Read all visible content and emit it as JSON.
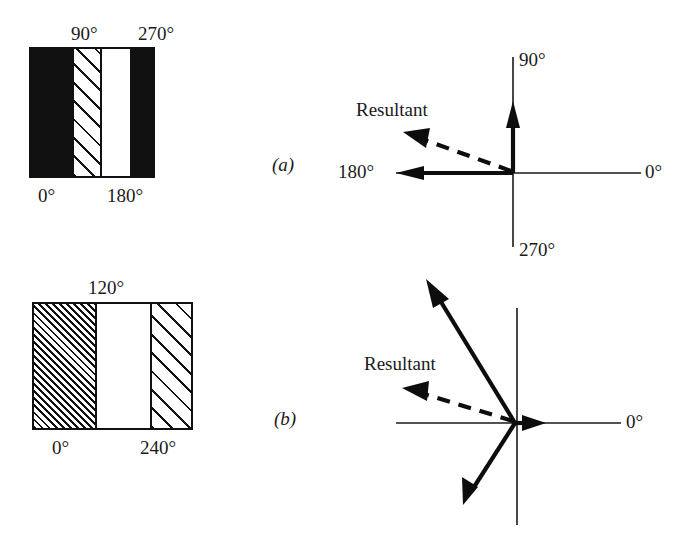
{
  "figure": {
    "panels": [
      {
        "mark": "(a)",
        "bar": {
          "labels_top": [
            "90°",
            "270°"
          ],
          "labels_bottom": [
            "0°",
            "180°"
          ],
          "bands": [
            {
              "fill": "black",
              "start_deg": 0
            },
            {
              "fill": "hatched",
              "start_deg": 90
            },
            {
              "fill": "white",
              "start_deg": 180
            },
            {
              "fill": "black",
              "start_deg": 270
            }
          ]
        },
        "vector_plot": {
          "axis_labels": {
            "right": "0°",
            "up": "90°",
            "left": "180°",
            "down": "270°"
          },
          "vectors": [
            {
              "label": "90°",
              "angle_deg": 90,
              "style": "solid"
            },
            {
              "label": "180°",
              "angle_deg": 180,
              "style": "solid"
            }
          ],
          "resultant": {
            "label": "Resultant",
            "angle_deg": 160,
            "style": "dashed"
          }
        }
      },
      {
        "mark": "(b)",
        "bar": {
          "labels_top": [
            "120°"
          ],
          "labels_bottom": [
            "0°",
            "240°"
          ],
          "bands": [
            {
              "fill": "hatched-dense",
              "start_deg": 0
            },
            {
              "fill": "white",
              "start_deg": 120
            },
            {
              "fill": "hatched-wide",
              "start_deg": 240
            }
          ]
        },
        "vector_plot": {
          "axis_labels": {
            "right": "0°"
          },
          "vectors": [
            {
              "label": "120°",
              "angle_deg": 120,
              "style": "solid"
            },
            {
              "label": "240°",
              "angle_deg": 240,
              "style": "solid"
            },
            {
              "label": "",
              "angle_deg": 0,
              "style": "solid"
            }
          ],
          "resultant": {
            "label": "Resultant",
            "angle_deg": 162,
            "style": "dashed"
          }
        }
      }
    ]
  },
  "colors": {
    "ink": "#111111",
    "paper": "#ffffff"
  }
}
